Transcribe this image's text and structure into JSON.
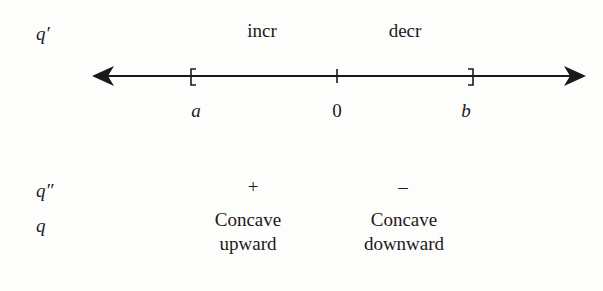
{
  "diagram": {
    "type": "sign-chart",
    "rows": {
      "q_prime": {
        "label": "q′",
        "intervals": [
          "incr",
          "decr"
        ]
      },
      "number_line": {
        "points": [
          "a",
          "0",
          "b"
        ],
        "left_endpoint": "[",
        "right_endpoint": "]"
      },
      "q_double_prime": {
        "label": "q″",
        "signs": [
          "+",
          "–"
        ]
      },
      "q": {
        "label": "q",
        "concavity": [
          "Concave upward",
          "Concave downward"
        ],
        "concavity_lines": [
          [
            "Concave",
            "upward"
          ],
          [
            "Concave",
            "downward"
          ]
        ]
      }
    },
    "colors": {
      "ink": "#1a1a1a",
      "background": "#fdfdfc"
    }
  }
}
